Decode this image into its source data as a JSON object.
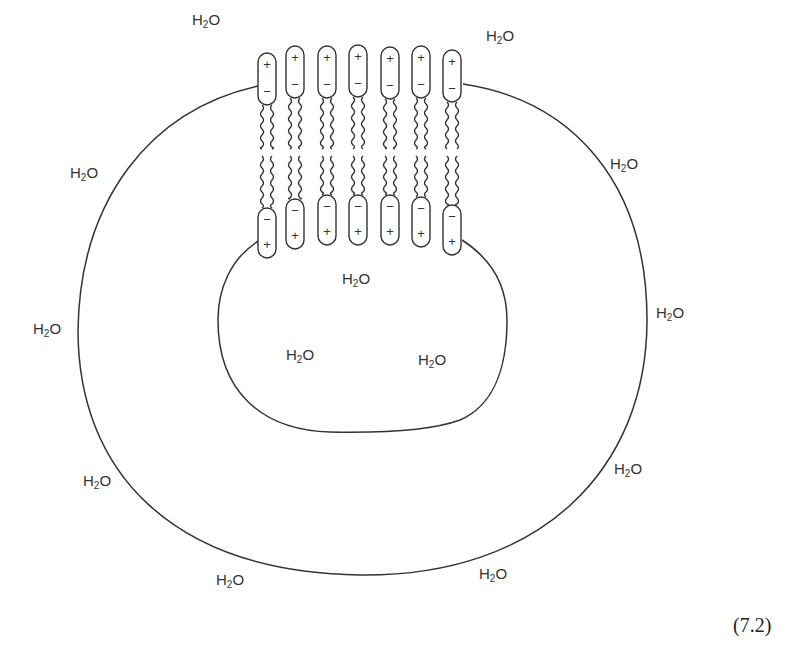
{
  "figure": {
    "equation_number": "(7.2)",
    "colors": {
      "line": "#333333",
      "text": "#333333",
      "background": "#ffffff"
    }
  },
  "water_labels": [
    {
      "id": "w1",
      "base": "H",
      "sub": "2",
      "tail": "O",
      "x": 192,
      "y": 12
    },
    {
      "id": "w2",
      "base": "H",
      "sub": "2",
      "tail": "O",
      "x": 486,
      "y": 28
    },
    {
      "id": "w3",
      "base": "H",
      "sub": "2",
      "tail": "O",
      "x": 70,
      "y": 165
    },
    {
      "id": "w4",
      "base": "H",
      "sub": "2",
      "tail": "O",
      "x": 610,
      "y": 156
    },
    {
      "id": "w5",
      "base": "H",
      "sub": "2",
      "tail": "O",
      "x": 342,
      "y": 271
    },
    {
      "id": "w6",
      "base": "H",
      "sub": "2",
      "tail": "O",
      "x": 33,
      "y": 321
    },
    {
      "id": "w7",
      "base": "H",
      "sub": "2",
      "tail": "O",
      "x": 656,
      "y": 305
    },
    {
      "id": "w8",
      "base": "H",
      "sub": "2",
      "tail": "O",
      "x": 286,
      "y": 347
    },
    {
      "id": "w9",
      "base": "H",
      "sub": "2",
      "tail": "O",
      "x": 418,
      "y": 352
    },
    {
      "id": "w10",
      "base": "H",
      "sub": "2",
      "tail": "O",
      "x": 614,
      "y": 461
    },
    {
      "id": "w11",
      "base": "H",
      "sub": "2",
      "tail": "O",
      "x": 83,
      "y": 473
    },
    {
      "id": "w12",
      "base": "H",
      "sub": "2",
      "tail": "O",
      "x": 216,
      "y": 572
    },
    {
      "id": "w13",
      "base": "H",
      "sub": "2",
      "tail": "O",
      "x": 479,
      "y": 566
    }
  ],
  "molecules": {
    "count": 7,
    "outer_head": {
      "top_sign": "+",
      "bottom_sign": "−"
    },
    "inner_head": {
      "top_sign": "−",
      "bottom_sign": "+"
    },
    "items": [
      {
        "x": 267,
        "top_head_y": 53,
        "bottom_head_y": 208
      },
      {
        "x": 295,
        "top_head_y": 46,
        "bottom_head_y": 199
      },
      {
        "x": 327,
        "top_head_y": 46,
        "bottom_head_y": 195
      },
      {
        "x": 358,
        "top_head_y": 45,
        "bottom_head_y": 195
      },
      {
        "x": 390,
        "top_head_y": 47,
        "bottom_head_y": 195
      },
      {
        "x": 421,
        "top_head_y": 46,
        "bottom_head_y": 197
      },
      {
        "x": 452,
        "top_head_y": 50,
        "bottom_head_y": 205
      }
    ]
  }
}
